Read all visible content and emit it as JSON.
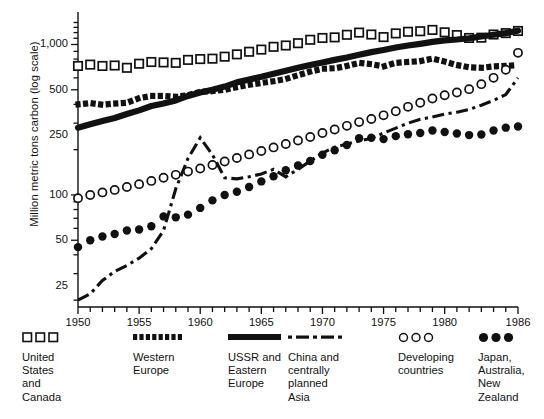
{
  "figure": {
    "ylabel": "Million metric tons carbon (log scale)",
    "xlabel": ""
  },
  "chart_data": {
    "type": "line",
    "title": "",
    "xlabel": "",
    "ylabel": "Million metric tons carbon (log scale)",
    "yscale": "log",
    "ylim": [
      18,
      1500
    ],
    "xlim": [
      1950,
      1986
    ],
    "grid": false,
    "legend_position": "below",
    "yticks": [
      25,
      50,
      100,
      250,
      500,
      1000
    ],
    "ytick_labels": [
      "25",
      "50",
      "100",
      "250",
      "500",
      "1,000"
    ],
    "xticks": [
      1950,
      1955,
      1960,
      1965,
      1970,
      1975,
      1980,
      1986
    ],
    "xtick_labels": [
      "1950",
      "1955",
      "1960",
      "1965",
      "1970",
      "1975",
      "1980",
      "1986"
    ],
    "xminor_interval": 1,
    "x": [
      1950,
      1951,
      1952,
      1953,
      1954,
      1955,
      1956,
      1957,
      1958,
      1959,
      1960,
      1961,
      1962,
      1963,
      1964,
      1965,
      1966,
      1967,
      1968,
      1969,
      1970,
      1971,
      1972,
      1973,
      1974,
      1975,
      1976,
      1977,
      1978,
      1979,
      1980,
      1981,
      1982,
      1983,
      1984,
      1985,
      1986
    ],
    "series": [
      {
        "name": "United States and Canada",
        "marker": "open-square",
        "style": "markers",
        "values": [
          720,
          735,
          720,
          725,
          700,
          745,
          765,
          760,
          755,
          790,
          800,
          805,
          830,
          860,
          895,
          925,
          965,
          985,
          1020,
          1075,
          1105,
          1115,
          1160,
          1200,
          1165,
          1120,
          1185,
          1215,
          1225,
          1250,
          1205,
          1155,
          1105,
          1110,
          1165,
          1190,
          1230
        ]
      },
      {
        "name": "Western Europe",
        "marker": "thick-dash",
        "style": "dotted-thick",
        "values": [
          400,
          408,
          398,
          405,
          410,
          440,
          455,
          455,
          450,
          460,
          485,
          490,
          500,
          520,
          540,
          555,
          570,
          590,
          625,
          660,
          690,
          695,
          720,
          755,
          740,
          715,
          755,
          765,
          775,
          805,
          770,
          730,
          705,
          700,
          715,
          720,
          730
        ]
      },
      {
        "name": "USSR and Eastern Europe",
        "marker": "solid-thick",
        "style": "solid-thick",
        "values": [
          280,
          295,
          310,
          325,
          345,
          365,
          390,
          405,
          425,
          455,
          480,
          500,
          525,
          560,
          585,
          610,
          640,
          670,
          700,
          730,
          760,
          790,
          820,
          855,
          890,
          920,
          955,
          985,
          1010,
          1040,
          1065,
          1080,
          1100,
          1130,
          1160,
          1190,
          1235
        ]
      },
      {
        "name": "China and centrally planned Asia",
        "marker": "dash-dot",
        "style": "dash-dot",
        "values": [
          20,
          22,
          27,
          31,
          34,
          38,
          44,
          58,
          110,
          175,
          240,
          185,
          130,
          128,
          132,
          138,
          148,
          132,
          148,
          168,
          190,
          208,
          218,
          228,
          238,
          258,
          278,
          300,
          318,
          330,
          345,
          355,
          370,
          395,
          425,
          465,
          600
        ]
      },
      {
        "name": "Developing countries",
        "marker": "open-circle",
        "style": "markers",
        "values": [
          95,
          100,
          104,
          108,
          113,
          118,
          124,
          130,
          136,
          143,
          150,
          158,
          167,
          176,
          186,
          196,
          207,
          218,
          230,
          243,
          258,
          272,
          288,
          305,
          320,
          338,
          360,
          385,
          410,
          438,
          460,
          480,
          505,
          545,
          600,
          680,
          880
        ]
      },
      {
        "name": "Japan, Australia, New Zealand",
        "marker": "filled-circle",
        "style": "markers",
        "values": [
          45,
          50,
          53,
          55,
          58,
          59,
          62,
          72,
          71,
          74,
          82,
          92,
          100,
          105,
          113,
          123,
          133,
          146,
          157,
          168,
          185,
          198,
          215,
          238,
          240,
          235,
          246,
          253,
          258,
          268,
          262,
          256,
          250,
          252,
          268,
          280,
          285
        ]
      }
    ]
  },
  "legend": {
    "items": [
      {
        "key": "open-square-key",
        "label": "United\nStates\nand\nCanada"
      },
      {
        "key": "thick-dash-key",
        "label": "Western\nEurope"
      },
      {
        "key": "solid-bar-key",
        "label": "USSR and\nEastern\nEurope"
      },
      {
        "key": "dash-dot-key",
        "label": "China and\ncentrally\nplanned\nAsia"
      },
      {
        "key": "open-circle-key",
        "label": "Developing\ncountries"
      },
      {
        "key": "filled-circle-key",
        "label": "Japan,\nAustralia,\nNew\nZealand"
      }
    ]
  }
}
